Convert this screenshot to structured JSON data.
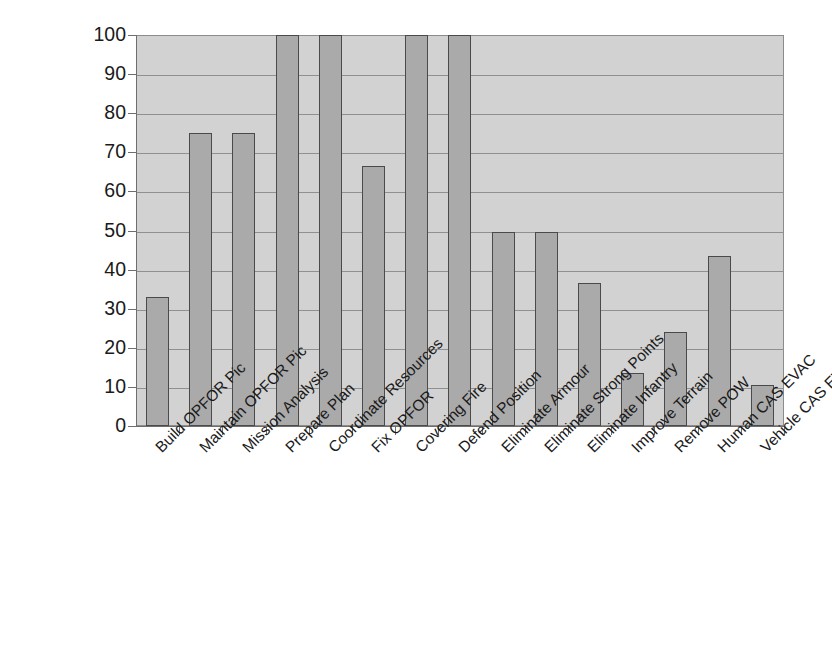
{
  "chart_data": {
    "type": "bar",
    "title": "",
    "xlabel": "",
    "ylabel": "",
    "ylim": [
      0,
      100
    ],
    "yticks": [
      0,
      10,
      20,
      30,
      40,
      50,
      60,
      70,
      80,
      90,
      100
    ],
    "ytick_labels": [
      "0",
      "10",
      "20",
      "30",
      "40",
      "50",
      "60",
      "70",
      "80",
      "90",
      "100"
    ],
    "grid": true,
    "legend": "none",
    "categories": [
      "Build OPFOR Pic",
      "Maintain OPFOR Pic",
      "Mission Analysis",
      "Prepare Plan",
      "Coordinate Resources",
      "Fix OPFOR",
      "Covering Fire",
      "Defend Position",
      "Eliminate Armour",
      "Eliminate Strong Points",
      "Eliminate Infantry",
      "Improve Terrain",
      "Remove POW",
      "Human CAS EVAC",
      "Vehicle CAS EVAC"
    ],
    "values": [
      33,
      75,
      75,
      100,
      100,
      66.5,
      100,
      100,
      49.5,
      49.5,
      36.5,
      13.5,
      24,
      43.5,
      10.5
    ],
    "colors": {
      "bar_fill": "#aaaaaa",
      "bar_border": "#4a4a4a",
      "plot_background": "#d2d2d2",
      "gridline": "#909090",
      "axis": "#6e6e6e",
      "text": "#1a1a1a",
      "page_background": "#ffffff"
    }
  }
}
